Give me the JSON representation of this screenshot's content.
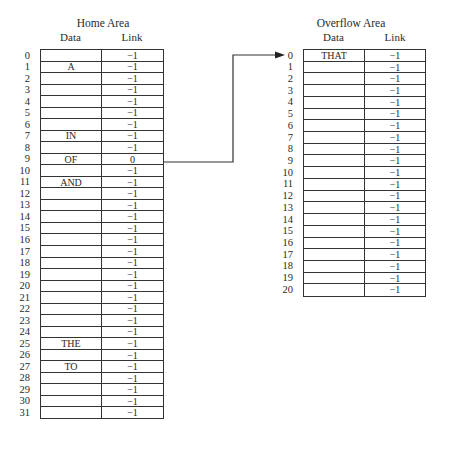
{
  "home_area": {
    "title": "Home Area",
    "columns": {
      "data": "Data",
      "link": "Link"
    },
    "rows": [
      {
        "index": "0",
        "data": "",
        "link": "−1"
      },
      {
        "index": "1",
        "data": "A",
        "link": "−1"
      },
      {
        "index": "2",
        "data": "",
        "link": "−1"
      },
      {
        "index": "3",
        "data": "",
        "link": "−1"
      },
      {
        "index": "4",
        "data": "",
        "link": "−1"
      },
      {
        "index": "5",
        "data": "",
        "link": "−1"
      },
      {
        "index": "6",
        "data": "",
        "link": "−1"
      },
      {
        "index": "7",
        "data": "IN",
        "link": "−1"
      },
      {
        "index": "8",
        "data": "",
        "link": "−1"
      },
      {
        "index": "9",
        "data": "OF",
        "link": "0"
      },
      {
        "index": "10",
        "data": "",
        "link": "−1"
      },
      {
        "index": "11",
        "data": "AND",
        "link": "−1"
      },
      {
        "index": "12",
        "data": "",
        "link": "−1"
      },
      {
        "index": "13",
        "data": "",
        "link": "−1"
      },
      {
        "index": "14",
        "data": "",
        "link": "−1"
      },
      {
        "index": "15",
        "data": "",
        "link": "−1"
      },
      {
        "index": "16",
        "data": "",
        "link": "−1"
      },
      {
        "index": "17",
        "data": "",
        "link": "−1"
      },
      {
        "index": "18",
        "data": "",
        "link": "−1"
      },
      {
        "index": "19",
        "data": "",
        "link": "−1"
      },
      {
        "index": "20",
        "data": "",
        "link": "−1"
      },
      {
        "index": "21",
        "data": "",
        "link": "−1"
      },
      {
        "index": "22",
        "data": "",
        "link": "−1"
      },
      {
        "index": "23",
        "data": "",
        "link": "−1"
      },
      {
        "index": "24",
        "data": "",
        "link": "−1"
      },
      {
        "index": "25",
        "data": "THE",
        "link": "−1"
      },
      {
        "index": "26",
        "data": "",
        "link": "−1"
      },
      {
        "index": "27",
        "data": "TO",
        "link": "−1"
      },
      {
        "index": "28",
        "data": "",
        "link": "−1"
      },
      {
        "index": "29",
        "data": "",
        "link": "−1"
      },
      {
        "index": "30",
        "data": "",
        "link": "−1"
      },
      {
        "index": "31",
        "data": "",
        "link": "−1"
      }
    ]
  },
  "overflow_area": {
    "title": "Overflow Area",
    "columns": {
      "data": "Data",
      "link": "Link"
    },
    "rows": [
      {
        "index": "0",
        "data": "THAT",
        "link": "−1"
      },
      {
        "index": "1",
        "data": "",
        "link": "−1"
      },
      {
        "index": "2",
        "data": "",
        "link": "−1"
      },
      {
        "index": "3",
        "data": "",
        "link": "−1"
      },
      {
        "index": "4",
        "data": "",
        "link": "−1"
      },
      {
        "index": "5",
        "data": "",
        "link": "−1"
      },
      {
        "index": "6",
        "data": "",
        "link": "−1"
      },
      {
        "index": "7",
        "data": "",
        "link": "−1"
      },
      {
        "index": "8",
        "data": "",
        "link": "−1"
      },
      {
        "index": "9",
        "data": "",
        "link": "−1"
      },
      {
        "index": "10",
        "data": "",
        "link": "−1"
      },
      {
        "index": "11",
        "data": "",
        "link": "−1"
      },
      {
        "index": "12",
        "data": "",
        "link": "−1"
      },
      {
        "index": "13",
        "data": "",
        "link": "−1"
      },
      {
        "index": "14",
        "data": "",
        "link": "−1"
      },
      {
        "index": "15",
        "data": "",
        "link": "−1"
      },
      {
        "index": "16",
        "data": "",
        "link": "−1"
      },
      {
        "index": "17",
        "data": "",
        "link": "−1"
      },
      {
        "index": "18",
        "data": "",
        "link": "−1"
      },
      {
        "index": "19",
        "data": "",
        "link": "−1"
      },
      {
        "index": "20",
        "data": "",
        "link": "−1"
      }
    ]
  },
  "connector": {
    "from": "home_area.rows.9",
    "to": "overflow_area.rows.0",
    "line_color": "#333333"
  }
}
